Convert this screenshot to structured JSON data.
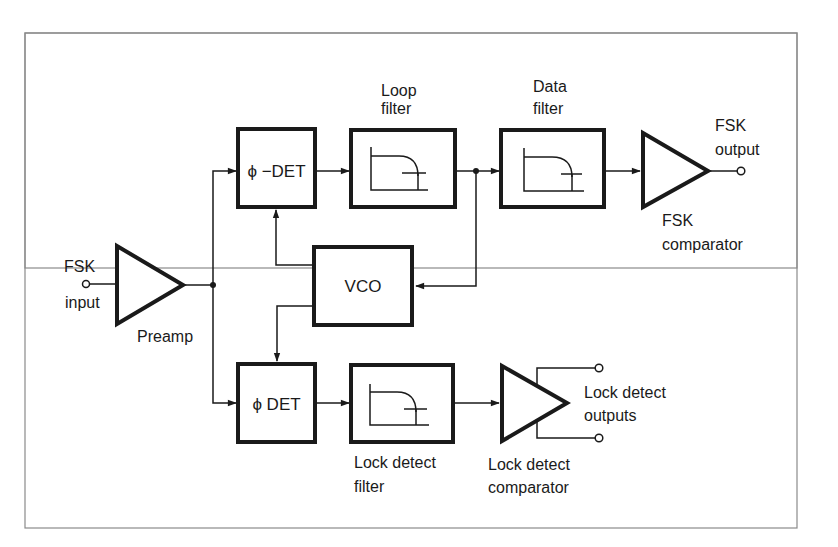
{
  "diagram": {
    "type": "block-diagram",
    "colors": {
      "stroke": "#1a1a1a",
      "frame": "#8a8a8a",
      "background": "#ffffff"
    },
    "labels": {
      "fsk_input": [
        "FSK",
        "input"
      ],
      "preamp": "Preamp",
      "loop_filter": [
        "Loop",
        "filter"
      ],
      "data_filter": [
        "Data",
        "filter"
      ],
      "fsk_output": [
        "FSK",
        "output"
      ],
      "fsk_comparator": [
        "FSK",
        "comparator"
      ],
      "lock_detect_filter": [
        "Lock detect",
        "filter"
      ],
      "lock_detect_comparator": [
        "Lock detect",
        "comparator"
      ],
      "lock_detect_outputs": [
        "Lock detect",
        "outputs"
      ]
    },
    "blocks": {
      "phase_detector": "ϕ −DET",
      "vco": "VCO",
      "lock_phase_detector": "ϕ DET"
    },
    "connections": [
      "FSK input -> Preamp",
      "Preamp -> ϕ−DET",
      "Preamp -> ϕ DET",
      "ϕ−DET -> Loop filter",
      "Loop filter -> Data filter",
      "Loop filter -> VCO",
      "VCO -> ϕ−DET",
      "VCO -> ϕ DET",
      "Data filter -> FSK comparator",
      "FSK comparator -> FSK output",
      "ϕ DET -> Lock detect filter",
      "Lock detect filter -> Lock detect comparator",
      "Lock detect comparator -> Lock detect outputs (2)"
    ]
  }
}
